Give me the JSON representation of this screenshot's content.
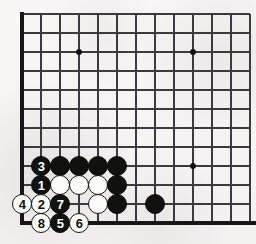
{
  "figure": {
    "name": "go-board-diagram",
    "kind": "go-game-diagram",
    "background_color": "#f6f5f3"
  },
  "board": {
    "line_color": "#3b3b3f",
    "edge_color": "#17171a",
    "origin_x": 22,
    "origin_y": 14,
    "spacing": 19.0,
    "columns": 13,
    "rows": 12,
    "star_points": [
      {
        "col": 3,
        "row": 2
      },
      {
        "col": 9,
        "row": 2
      },
      {
        "col": 9,
        "row": 8
      }
    ],
    "star_point_color": "#111110",
    "edges": {
      "left": true,
      "top": false,
      "bottom": true,
      "right": false
    }
  },
  "stones": {
    "black_color": "#111110",
    "white_color": "#fcfcfb",
    "plain": [
      {
        "color": "black",
        "col": 2,
        "row": 8
      },
      {
        "color": "black",
        "col": 3,
        "row": 8
      },
      {
        "color": "black",
        "col": 4,
        "row": 8
      },
      {
        "color": "black",
        "col": 5,
        "row": 8
      },
      {
        "color": "white",
        "col": 2,
        "row": 9
      },
      {
        "color": "white",
        "col": 3,
        "row": 9
      },
      {
        "color": "white",
        "col": 4,
        "row": 9
      },
      {
        "color": "black",
        "col": 5,
        "row": 9
      },
      {
        "color": "white",
        "col": 4,
        "row": 10
      },
      {
        "color": "black",
        "col": 5,
        "row": 10
      },
      {
        "color": "black",
        "col": 7,
        "row": 10
      }
    ],
    "numbered": [
      {
        "label": "3",
        "color": "black",
        "col": 1,
        "row": 8
      },
      {
        "label": "1",
        "color": "black",
        "col": 1,
        "row": 9
      },
      {
        "label": "4",
        "color": "white",
        "col": 0,
        "row": 10
      },
      {
        "label": "2",
        "color": "white",
        "col": 1,
        "row": 10
      },
      {
        "label": "7",
        "color": "black",
        "col": 2,
        "row": 10
      },
      {
        "label": "8",
        "color": "white",
        "col": 1,
        "row": 11
      },
      {
        "label": "5",
        "color": "black",
        "col": 2,
        "row": 11
      },
      {
        "label": "6",
        "color": "white",
        "col": 3,
        "row": 11
      }
    ]
  }
}
